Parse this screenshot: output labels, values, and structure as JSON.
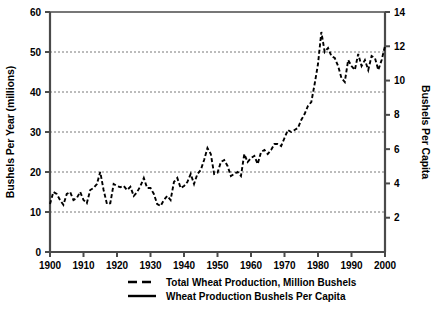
{
  "chart_data": {
    "type": "line",
    "title": "",
    "xlabel": "",
    "ylabel": "Bushels Per Year (millions)",
    "y2label": "Bushels Per Capita",
    "xlim": [
      1900,
      2000
    ],
    "ylim": [
      0,
      60
    ],
    "y2lim": [
      0,
      14
    ],
    "grid": true,
    "legend_position": "bottom",
    "xticks": [
      1900,
      1910,
      1920,
      1930,
      1940,
      1950,
      1960,
      1970,
      1980,
      1990,
      2000
    ],
    "yticks": [
      0,
      10,
      20,
      30,
      40,
      50,
      60
    ],
    "y2ticks": [
      2,
      4,
      6,
      8,
      10,
      12,
      14
    ],
    "gridlines_y": [
      10,
      20,
      30,
      40,
      50
    ],
    "x": [
      1900,
      1901,
      1902,
      1903,
      1904,
      1905,
      1906,
      1907,
      1908,
      1909,
      1910,
      1911,
      1912,
      1913,
      1914,
      1915,
      1916,
      1917,
      1918,
      1919,
      1920,
      1921,
      1922,
      1923,
      1924,
      1925,
      1926,
      1927,
      1928,
      1929,
      1930,
      1931,
      1932,
      1933,
      1934,
      1935,
      1936,
      1937,
      1938,
      1939,
      1940,
      1941,
      1942,
      1943,
      1944,
      1945,
      1946,
      1947,
      1948,
      1949,
      1950,
      1951,
      1952,
      1953,
      1954,
      1955,
      1956,
      1957,
      1958,
      1959,
      1960,
      1961,
      1962,
      1963,
      1964,
      1965,
      1966,
      1967,
      1968,
      1969,
      1970,
      1971,
      1972,
      1973,
      1974,
      1975,
      1976,
      1977,
      1978,
      1979,
      1980,
      1981,
      1982,
      1983,
      1984,
      1985,
      1986,
      1987,
      1988,
      1989,
      1990,
      1991,
      1992,
      1993,
      1994,
      1995,
      1996,
      1997,
      1998,
      1999,
      2000
    ],
    "series": [
      {
        "name": "Total Wheat Production, Million Bushels",
        "axis": "left",
        "style": "dashed",
        "color": "#000000",
        "values": [
          12.0,
          15.0,
          14.5,
          13.0,
          11.8,
          14.5,
          15.0,
          13.0,
          13.5,
          15.0,
          13.0,
          12.2,
          15.5,
          16.0,
          17.0,
          20.0,
          15.5,
          12.0,
          12.2,
          17.0,
          16.5,
          16.2,
          16.5,
          15.5,
          16.3,
          14.0,
          15.0,
          16.5,
          18.5,
          16.0,
          16.0,
          14.5,
          12.0,
          11.5,
          13.0,
          14.0,
          13.0,
          17.5,
          18.5,
          16.0,
          16.5,
          17.5,
          19.5,
          17.0,
          19.5,
          20.5,
          23.0,
          26.0,
          24.5,
          19.5,
          19.8,
          22.5,
          23.0,
          21.5,
          19.0,
          19.5,
          20.0,
          19.0,
          24.5,
          22.5,
          23.5,
          24.0,
          22.0,
          25.0,
          25.5,
          24.5,
          25.5,
          27.0,
          27.0,
          26.5,
          28.5,
          30.5,
          30.0,
          30.5,
          31.0,
          33.0,
          34.5,
          36.5,
          37.5,
          42.0,
          47.0,
          55.0,
          50.0,
          51.0,
          49.0,
          48.5,
          46.5,
          43.5,
          42.5,
          48.0,
          46.5,
          45.5,
          49.5,
          46.5,
          48.0,
          45.5,
          49.0,
          48.5,
          45.5,
          48.0,
          51.5
        ]
      },
      {
        "name": "Wheat Production Bushels Per Capita",
        "axis": "right",
        "style": "solid",
        "color": "#000000",
        "values": [
          36.0,
          41.5,
          36.0,
          34.5,
          29.0,
          37.0,
          36.5,
          31.0,
          31.5,
          34.5,
          31.0,
          30.5,
          34.0,
          33.0,
          33.5,
          43.0,
          33.0,
          26.0,
          25.5,
          33.0,
          40.0,
          31.0,
          33.0,
          30.0,
          31.5,
          26.5,
          30.0,
          31.5,
          33.0,
          30.0,
          29.5,
          31.5,
          33.0,
          21.0,
          18.0,
          20.5,
          20.5,
          29.5,
          30.0,
          25.5,
          26.5,
          27.5,
          31.5,
          26.5,
          28.5,
          30.0,
          33.5,
          41.5,
          38.0,
          28.5,
          27.5,
          31.5,
          35.0,
          30.0,
          25.0,
          27.0,
          28.0,
          24.5,
          35.0,
          28.5,
          31.5,
          30.0,
          25.5,
          31.0,
          29.5,
          25.5,
          26.5,
          31.0,
          30.0,
          29.5,
          28.0,
          31.5,
          30.0,
          32.5,
          33.5,
          39.5,
          41.0,
          36.5,
          34.5,
          38.5,
          40.0,
          50.5,
          49.5,
          37.5,
          39.5,
          42.5,
          41.0,
          36.5,
          36.5,
          39.5,
          31.0,
          53.0,
          32.0,
          36.0,
          38.0,
          38.0,
          34.0,
          40.0,
          36.5,
          38.5,
          40.0
        ]
      }
    ]
  },
  "axes": {
    "left": {
      "label": "Bushels Per Year (millions)",
      "ticks": [
        "0",
        "10",
        "20",
        "30",
        "40",
        "50",
        "60"
      ]
    },
    "right": {
      "label": "Bushels Per Capita",
      "ticks": [
        "2",
        "4",
        "6",
        "8",
        "10",
        "12",
        "14"
      ]
    },
    "bottom": {
      "ticks": [
        "1900",
        "1910",
        "1920",
        "1930",
        "1940",
        "1950",
        "1960",
        "1970",
        "1980",
        "1990",
        "2000"
      ]
    }
  },
  "legend": {
    "items": [
      {
        "label": "Total Wheat Production, Million Bushels",
        "style": "dashed"
      },
      {
        "label": "Wheat Production Bushels Per Capita",
        "style": "solid"
      }
    ]
  },
  "colors": {
    "line": "#000000",
    "axis": "#4a4a4a",
    "grid": "#555555",
    "background": "#ffffff"
  }
}
